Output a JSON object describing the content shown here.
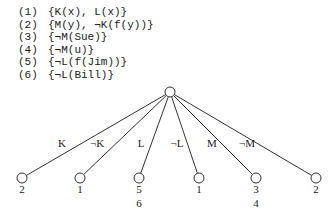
{
  "clauses": [
    {
      "num": "(1)",
      "text": "{K(x), L(x)}"
    },
    {
      "num": "(2)",
      "text": "{M(y), ¬K(f(y))}"
    },
    {
      "num": "(3)",
      "text": "{¬M(Sue)}"
    },
    {
      "num": "(4)",
      "text": "{¬M(u)}"
    },
    {
      "num": "(5)",
      "text": "{¬L(f(Jim))}"
    },
    {
      "num": "(6)",
      "text": "{¬L(Bill)}"
    }
  ],
  "tree": {
    "root": {
      "x": 170,
      "y": 92
    },
    "edges": [
      {
        "label": "K",
        "leaf_x": 22,
        "label_x": 62,
        "leaf_labels": [
          "2"
        ]
      },
      {
        "label": "¬K",
        "leaf_x": 80,
        "label_x": 97,
        "leaf_labels": [
          "1"
        ]
      },
      {
        "label": "L",
        "leaf_x": 139,
        "label_x": 141,
        "leaf_labels": [
          "5",
          "6"
        ]
      },
      {
        "label": "¬L",
        "leaf_x": 199,
        "label_x": 177,
        "leaf_labels": [
          "1"
        ]
      },
      {
        "label": "M",
        "leaf_x": 256,
        "label_x": 212,
        "leaf_labels": [
          "3",
          "4"
        ]
      },
      {
        "label": "¬M",
        "leaf_x": 316,
        "label_x": 247,
        "leaf_labels": [
          "2"
        ]
      }
    ]
  }
}
